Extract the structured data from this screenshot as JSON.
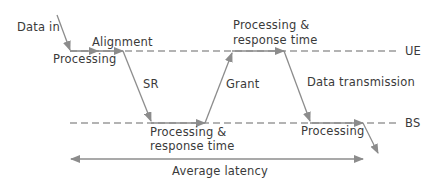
{
  "diagram": {
    "type": "latency-timing-diagram",
    "colors": {
      "line": "#8c8c8c",
      "text": "#3a3a3a",
      "background": "#ffffff"
    },
    "lanes": [
      {
        "id": "ue",
        "label": "UE",
        "y": 51
      },
      {
        "id": "bs",
        "label": "BS",
        "y": 123
      }
    ],
    "labels": {
      "data_in": "Data in",
      "alignment": "Alignment",
      "processing_ue_1": "Processing",
      "sr": "SR",
      "processing_response_bs_line1": "Processing &",
      "processing_response_bs_line2": "response time",
      "grant": "Grant",
      "processing_response_ue_line1": "Processing &",
      "processing_response_ue_line2": "response time",
      "data_transmission": "Data transmission",
      "processing_bs_2": "Processing",
      "ue": "UE",
      "bs": "BS",
      "average_latency": "Average latency"
    },
    "steps": [
      {
        "from": "input",
        "to": "ue",
        "label": "Data in"
      },
      {
        "lane": "ue",
        "label": "Processing"
      },
      {
        "lane": "ue",
        "label": "Alignment"
      },
      {
        "from": "ue",
        "to": "bs",
        "label": "SR"
      },
      {
        "lane": "bs",
        "label": "Processing & response time"
      },
      {
        "from": "bs",
        "to": "ue",
        "label": "Grant"
      },
      {
        "lane": "ue",
        "label": "Processing & response time"
      },
      {
        "from": "ue",
        "to": "bs",
        "label": "Data transmission"
      },
      {
        "lane": "bs",
        "label": "Processing"
      },
      {
        "from": "bs",
        "to": "output",
        "label": ""
      }
    ],
    "span": {
      "label": "Average latency",
      "type": "double-arrow"
    }
  }
}
